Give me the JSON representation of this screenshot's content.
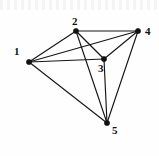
{
  "figure": {
    "title": "",
    "caption": "",
    "background_color": "#fefefe",
    "edge_color": "#161616",
    "vertex_color": "#111111",
    "label_color": "#111111"
  },
  "graph_data": {
    "type": "graph",
    "description": "Undirected complete graph on five labeled vertices",
    "vertex_count": 5,
    "edge_count": 10,
    "directed": false,
    "weighted": false,
    "vertices": [
      {
        "id": "1",
        "label": "1",
        "x": 29,
        "y": 62,
        "label_x": 14,
        "label_y": 46,
        "degree": 4
      },
      {
        "id": "2",
        "label": "2",
        "x": 76,
        "y": 31,
        "label_x": 72,
        "label_y": 16,
        "degree": 4
      },
      {
        "id": "3",
        "label": "3",
        "x": 104,
        "y": 59,
        "label_x": 98,
        "label_y": 63,
        "degree": 4
      },
      {
        "id": "4",
        "label": "4",
        "x": 138,
        "y": 31,
        "label_x": 145,
        "label_y": 26,
        "degree": 4
      },
      {
        "id": "5",
        "label": "5",
        "x": 107,
        "y": 123,
        "label_x": 112,
        "label_y": 125,
        "degree": 4
      }
    ],
    "edges": [
      {
        "from": "1",
        "to": "2"
      },
      {
        "from": "1",
        "to": "3"
      },
      {
        "from": "1",
        "to": "4"
      },
      {
        "from": "1",
        "to": "5"
      },
      {
        "from": "2",
        "to": "3"
      },
      {
        "from": "2",
        "to": "4"
      },
      {
        "from": "2",
        "to": "5"
      },
      {
        "from": "3",
        "to": "4"
      },
      {
        "from": "3",
        "to": "5"
      },
      {
        "from": "4",
        "to": "5"
      }
    ]
  },
  "labels": {
    "v1": "1",
    "v2": "2",
    "v3": "3",
    "v4": "4",
    "v5": "5"
  }
}
